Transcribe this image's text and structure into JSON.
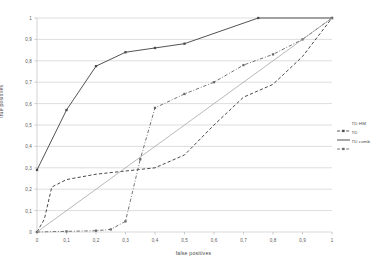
{
  "chart_data": {
    "type": "line",
    "title": "",
    "xlabel": "false positives",
    "ylabel": "true positives",
    "xlim": [
      0,
      1
    ],
    "ylim": [
      0,
      1
    ],
    "grid": true,
    "legend_position": "right",
    "xticks": [
      "0",
      "0,1",
      "0,2",
      "0,3",
      "0,4",
      "0,5",
      "0,6",
      "0,7",
      "0,8",
      "0,9",
      "1"
    ],
    "yticks": [
      "0",
      "0,1",
      "0,2",
      "0,3",
      "0,4",
      "0,5",
      "0,6",
      "0,7",
      "0,8",
      "0,9",
      "1"
    ],
    "xtick_values": [
      0,
      0.1,
      0.2,
      0.3,
      0.4,
      0.5,
      0.6,
      0.7,
      0.8,
      0.9,
      1
    ],
    "ytick_values": [
      0,
      0.1,
      0.2,
      0.3,
      0.4,
      0.5,
      0.6,
      0.7,
      0.8,
      0.9,
      1
    ],
    "series": [
      {
        "name": "TD HM",
        "style": "solid",
        "marker": "square",
        "color": "#4a4a4a",
        "x": [
          0,
          0.1,
          0.2,
          0.3,
          0.4,
          0.5,
          0.75,
          1
        ],
        "y": [
          0.29,
          0.57,
          0.775,
          0.84,
          0.86,
          0.88,
          1,
          1
        ]
      },
      {
        "name": "TD",
        "style": "dashed",
        "marker": "none",
        "color": "#3f3f3f",
        "x": [
          0,
          0.025,
          0.05,
          0.1,
          0.2,
          0.3,
          0.4,
          0.5,
          0.6,
          0.7,
          0.8,
          0.9,
          1
        ],
        "y": [
          0,
          0.06,
          0.21,
          0.245,
          0.27,
          0.285,
          0.3,
          0.36,
          0.5,
          0.63,
          0.69,
          0.82,
          1
        ]
      },
      {
        "name": "TD comb",
        "style": "dash-dot",
        "marker": "square",
        "color": "#6b6b6b",
        "x": [
          0,
          0.1,
          0.2,
          0.25,
          0.3,
          0.35,
          0.4,
          0.5,
          0.6,
          0.7,
          0.8,
          0.9,
          1
        ],
        "y": [
          0,
          0.003,
          0.006,
          0.012,
          0.05,
          0.34,
          0.58,
          0.645,
          0.7,
          0.78,
          0.83,
          0.9,
          1
        ]
      },
      {
        "name": "diagonal-reference",
        "style": "solid-thin",
        "marker": "none",
        "color": "#9a9a9a",
        "x": [
          0,
          1
        ],
        "y": [
          0,
          1
        ]
      }
    ],
    "legend": [
      {
        "label": "TD HM",
        "style": "dash-marker",
        "color": "#4a4a4a"
      },
      {
        "label": "TD",
        "style": "dash",
        "color": "#3f3f3f"
      },
      {
        "label": "TD comb",
        "style": "dash-marker2",
        "color": "#6b6b6b"
      }
    ]
  }
}
